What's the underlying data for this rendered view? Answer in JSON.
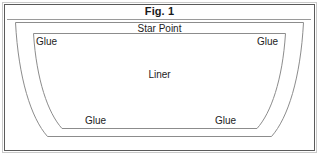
{
  "figure": {
    "title": "Fig. 1",
    "labels": {
      "star_point": "Star Point",
      "liner": "Liner",
      "glue_top_left": "Glue",
      "glue_top_right": "Glue",
      "glue_bottom_left": "Glue",
      "glue_bottom_right": "Glue"
    },
    "colors": {
      "frame_outer": "#c9c9c9",
      "frame_inner": "#5a5a5a",
      "divider": "#9a9a9a",
      "shape_stroke": "#8c8c8c",
      "text": "#1c1c1c",
      "background": "#ffffff"
    },
    "shapes": {
      "outer_panel_name": "outer-liner-outline",
      "inner_panel_name": "inner-liner-outline"
    }
  }
}
